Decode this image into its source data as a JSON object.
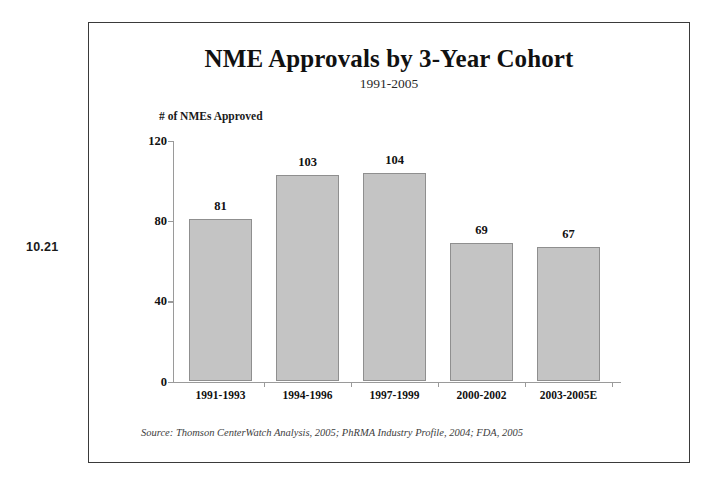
{
  "margin": {
    "slide_number": "10.21"
  },
  "chart_data": {
    "type": "bar",
    "title": "NME Approvals by 3-Year Cohort",
    "subtitle": "1991-2005",
    "ylabel": "# of NMEs Approved",
    "xlabel": "",
    "categories": [
      "1991-1993",
      "1994-1996",
      "1997-1999",
      "2000-2002",
      "2003-2005E"
    ],
    "values": [
      81,
      103,
      104,
      69,
      67
    ],
    "value_labels": [
      "81",
      "103",
      "104",
      "69",
      "67"
    ],
    "ylim": [
      0,
      120
    ],
    "yticks": [
      0,
      40,
      80,
      120
    ],
    "ytick_labels": [
      "0",
      "40",
      "80",
      "120"
    ],
    "grid": false,
    "legend": false,
    "bar_color": "#c4c4c4",
    "bar_border_color": "#8f8f8f",
    "axis_color": "#9a9a9a",
    "text_color": "#111111"
  },
  "source": {
    "note": "Source: Thomson CenterWatch Analysis, 2005; PhRMA Industry Profile, 2004; FDA, 2005"
  }
}
